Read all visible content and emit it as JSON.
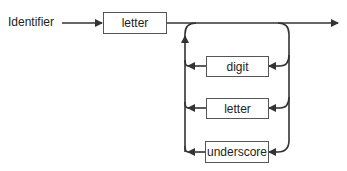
{
  "diagram": {
    "type": "syntax-diagram",
    "entry_label": "Identifier",
    "first_element": "letter",
    "loop_elements": [
      "digit",
      "letter",
      "underscore"
    ],
    "line_color": "#333333"
  }
}
